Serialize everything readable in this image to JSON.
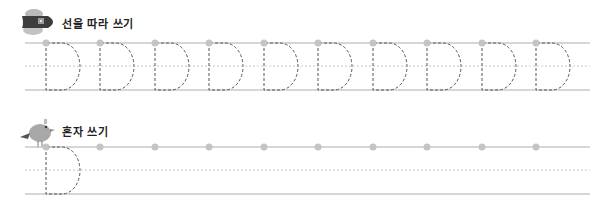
{
  "sections": [
    {
      "id": "trace",
      "title": "선을 따라 쓰기",
      "icon": "airplane-icon",
      "letter": "D",
      "letter_count": 10,
      "dot_count": 10
    },
    {
      "id": "free",
      "title": "혼자 쓰기",
      "icon": "bird-icon",
      "letter": "D",
      "letter_count": 1,
      "dot_count": 10
    }
  ],
  "colors": {
    "line": "#c8c8c8",
    "dotted": "#c8c8c8",
    "dot": "#c4c4c4",
    "letter_stroke": "#555555"
  }
}
